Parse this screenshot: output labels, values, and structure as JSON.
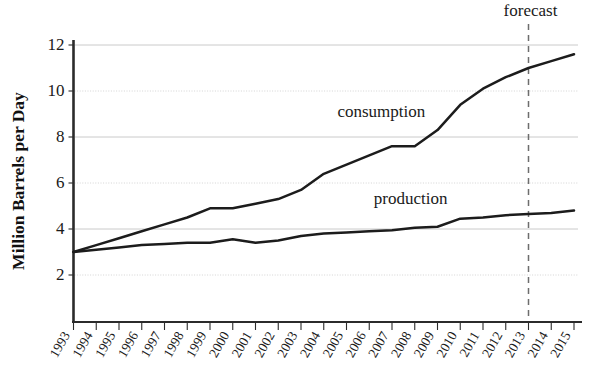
{
  "figure": {
    "background_color": "#ffffff",
    "line_color": "#1c1c1c",
    "grid_color": "#bdbdbd",
    "forecast_color": "#6d6d6d",
    "top_cropped_text": "",
    "y_axis_title": "Million Barrels per Day",
    "annotations": {
      "forecast": "forecast"
    },
    "series_labels": {
      "consumption": "consumption",
      "production": "production"
    }
  },
  "chart_data": {
    "type": "line",
    "title": "",
    "subtitle": "",
    "xlabel": "",
    "ylabel": "Million Barrels per Day",
    "xlim": [
      1993,
      2015
    ],
    "ylim": [
      1,
      12.6
    ],
    "yticks": [
      2,
      4,
      6,
      8,
      10,
      12
    ],
    "ytick_labels": [
      "2",
      "4",
      "6",
      "8",
      "10",
      "12"
    ],
    "grid": true,
    "grid_axis": "y",
    "legend": "inline-labels",
    "x": [
      1993,
      1994,
      1995,
      1996,
      1997,
      1998,
      1999,
      2000,
      2001,
      2002,
      2003,
      2004,
      2005,
      2006,
      2007,
      2008,
      2009,
      2010,
      2011,
      2012,
      2013,
      2014,
      2015
    ],
    "xtick_labels": [
      "1993",
      "1994",
      "1995",
      "1996",
      "1997",
      "1998",
      "1999",
      "2000",
      "2001",
      "2002",
      "2003",
      "2004",
      "2005",
      "2006",
      "2007",
      "2008",
      "2009",
      "2010",
      "2011",
      "2012",
      "2013",
      "2014",
      "2015"
    ],
    "series": [
      {
        "name": "consumption",
        "label": "consumption",
        "label_x": 2004.6,
        "label_y": 8.85,
        "values": [
          3.0,
          3.3,
          3.6,
          3.9,
          4.2,
          4.5,
          4.9,
          4.9,
          5.1,
          5.3,
          5.7,
          6.4,
          6.8,
          7.2,
          7.6,
          7.6,
          8.3,
          9.4,
          10.1,
          10.6,
          11.0,
          11.3,
          11.6
        ]
      },
      {
        "name": "production",
        "label": "production",
        "label_x": 2006.2,
        "label_y": 5.1,
        "values": [
          3.0,
          3.1,
          3.2,
          3.3,
          3.35,
          3.4,
          3.4,
          3.55,
          3.4,
          3.5,
          3.7,
          3.8,
          3.85,
          3.9,
          3.95,
          4.05,
          4.1,
          4.45,
          4.5,
          4.6,
          4.65,
          4.7,
          4.8
        ]
      }
    ],
    "annotations": [
      {
        "name": "forecast",
        "text": "forecast",
        "x": 2013,
        "type": "vertical-dashed-line"
      }
    ]
  }
}
